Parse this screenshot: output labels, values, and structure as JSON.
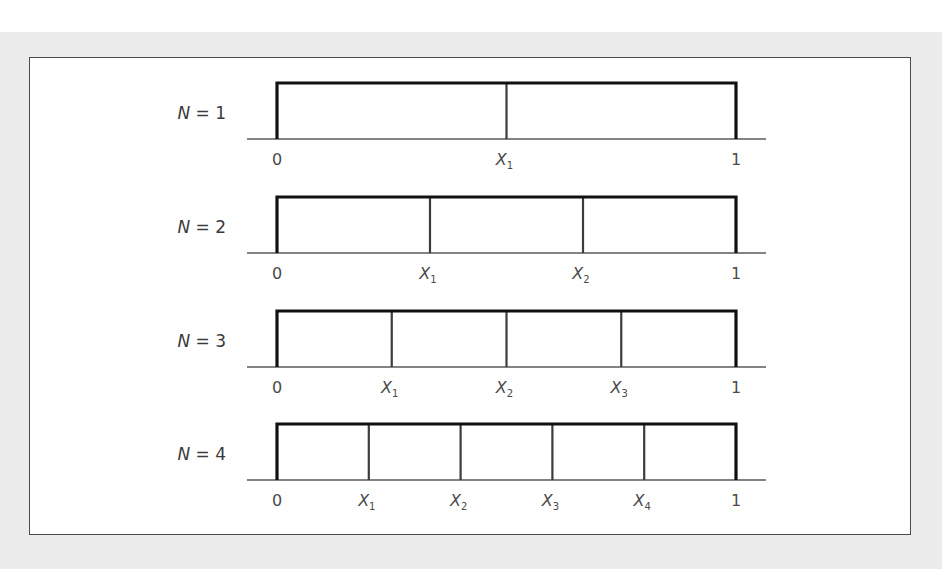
{
  "figure": {
    "rows": [
      {
        "label_var": "N",
        "label_eq": " = 1",
        "n": 1,
        "dividers": [
          0.5
        ],
        "ticks": [
          {
            "pos": 0,
            "text": "0",
            "italic": false,
            "sub": ""
          },
          {
            "pos": 0.5,
            "text": "X",
            "italic": true,
            "sub": "1"
          },
          {
            "pos": 1,
            "text": "1",
            "italic": false,
            "sub": ""
          }
        ]
      },
      {
        "label_var": "N",
        "label_eq": " = 2",
        "n": 2,
        "dividers": [
          0.3333,
          0.6667
        ],
        "ticks": [
          {
            "pos": 0,
            "text": "0",
            "italic": false,
            "sub": ""
          },
          {
            "pos": 0.3333,
            "text": "X",
            "italic": true,
            "sub": "1"
          },
          {
            "pos": 0.6667,
            "text": "X",
            "italic": true,
            "sub": "2"
          },
          {
            "pos": 1,
            "text": "1",
            "italic": false,
            "sub": ""
          }
        ]
      },
      {
        "label_var": "N",
        "label_eq": " = 3",
        "n": 3,
        "dividers": [
          0.25,
          0.5,
          0.75
        ],
        "ticks": [
          {
            "pos": 0,
            "text": "0",
            "italic": false,
            "sub": ""
          },
          {
            "pos": 0.25,
            "text": "X",
            "italic": true,
            "sub": "1"
          },
          {
            "pos": 0.5,
            "text": "X",
            "italic": true,
            "sub": "2"
          },
          {
            "pos": 0.75,
            "text": "X",
            "italic": true,
            "sub": "3"
          },
          {
            "pos": 1,
            "text": "1",
            "italic": false,
            "sub": ""
          }
        ]
      },
      {
        "label_var": "N",
        "label_eq": " = 4",
        "n": 4,
        "dividers": [
          0.2,
          0.4,
          0.6,
          0.8
        ],
        "ticks": [
          {
            "pos": 0,
            "text": "0",
            "italic": false,
            "sub": ""
          },
          {
            "pos": 0.2,
            "text": "X",
            "italic": true,
            "sub": "1"
          },
          {
            "pos": 0.4,
            "text": "X",
            "italic": true,
            "sub": "2"
          },
          {
            "pos": 0.6,
            "text": "X",
            "italic": true,
            "sub": "3"
          },
          {
            "pos": 0.8,
            "text": "X",
            "italic": true,
            "sub": "4"
          },
          {
            "pos": 1,
            "text": "1",
            "italic": false,
            "sub": ""
          }
        ]
      }
    ],
    "colors": {
      "frame": "#111111",
      "divider": "#3c3c3c",
      "axis": "#5a5a5a",
      "text": "#444444",
      "backdrop": "#ececec",
      "panel": "#ffffff"
    }
  }
}
